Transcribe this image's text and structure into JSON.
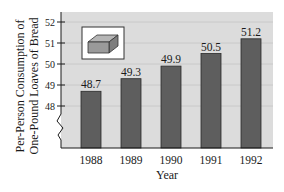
{
  "chart_data": {
    "type": "bar",
    "title": "",
    "xlabel": "Year",
    "ylabel_lines": [
      "Per-Person Consumption of",
      "One-Pound Loaves of Bread"
    ],
    "ylabel": "Per-Person Consumption of One-Pound Loaves of Bread",
    "categories": [
      "1988",
      "1989",
      "1990",
      "1991",
      "1992"
    ],
    "values": [
      48.7,
      49.3,
      49.9,
      50.5,
      51.2
    ],
    "data_labels": [
      "48.7",
      "49.3",
      "49.9",
      "50.5",
      "51.2"
    ],
    "ylim": [
      48,
      52
    ],
    "yticks": [
      48,
      49,
      50,
      51,
      52
    ],
    "ytick_labels": [
      "48",
      "49",
      "50",
      "51",
      "52"
    ],
    "axis_break": true,
    "grid": true,
    "legend": null,
    "inset_icon": "bread-loaf-icon",
    "colors": {
      "plot_background": "#dcdcdc",
      "bar_fill": "#5e5e5e",
      "bar_stroke": "#2a2a2a",
      "gridline": "#c4c4c4",
      "axis": "#1a1a1a",
      "icon_fill": "#9a9a9a"
    }
  }
}
